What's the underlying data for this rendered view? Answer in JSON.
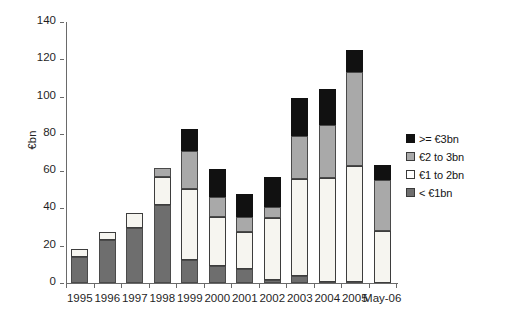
{
  "chart_data": {
    "type": "bar",
    "subtype": "stacked-bar",
    "title": "",
    "xlabel": "",
    "ylabel": "€bn",
    "ylim": [
      0,
      140
    ],
    "ytick_step": 20,
    "yticks": [
      0,
      20,
      40,
      60,
      80,
      100,
      120,
      140
    ],
    "ytick_labels": [
      "0",
      "20",
      "40",
      "60",
      "80",
      "100",
      "120",
      "140"
    ],
    "grid": false,
    "legend_position": "right",
    "categories": [
      "1995",
      "1996",
      "1997",
      "1998",
      "1999",
      "2000",
      "2001",
      "2002",
      "2003",
      "2004",
      "2005",
      "May-06"
    ],
    "series": [
      {
        "name": "< €1bn",
        "color": "#6e6e6e",
        "values": [
          14,
          23,
          29.5,
          42,
          12.5,
          9,
          7.5,
          1.5,
          4,
          0.5,
          0.5,
          0
        ]
      },
      {
        "name": "€1 to 2bn",
        "color": "#f6f5f0",
        "values": [
          4.5,
          4.5,
          8,
          15,
          38,
          26.5,
          20,
          33.5,
          52,
          56,
          62.5,
          28
        ]
      },
      {
        "name": "€2 to 3bn",
        "color": "#a9a9a9",
        "values": [
          0,
          0,
          0,
          4.5,
          20.5,
          10.5,
          8,
          6,
          23,
          28,
          50,
          27.5
        ]
      },
      {
        "name": ">= €3bn",
        "color": "#111111",
        "values": [
          0,
          0,
          0,
          0,
          11.5,
          15,
          12,
          16,
          20.5,
          19.5,
          12,
          8
        ]
      }
    ],
    "totals": [
      18.5,
      27.5,
      37.5,
      61.5,
      82.5,
      61,
      47.5,
      57,
      99.5,
      104,
      125,
      63.5
    ]
  },
  "legend": {
    "items": [
      {
        "label": ">= €3bn",
        "key": "gte3"
      },
      {
        "label": "€2 to 3bn",
        "key": "2to3"
      },
      {
        "label": "€1 to 2bn",
        "key": "1to2"
      },
      {
        "label": "< €1bn",
        "key": "lt1"
      }
    ]
  },
  "axis": {
    "y_title": "€bn"
  }
}
